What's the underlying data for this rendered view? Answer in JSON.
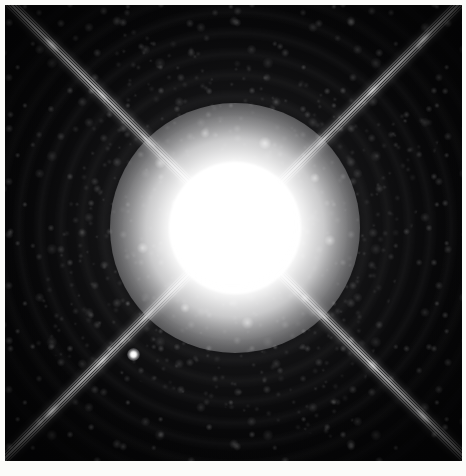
{
  "image": {
    "kind": "astronomical-photograph",
    "subject": "binary star system with diffraction spikes",
    "primary_star": {
      "name": "Sirius A",
      "role": "bright saturated primary",
      "center_x_pct": 50.3,
      "center_y_pct": 48.9,
      "core_radius_px": 66,
      "appearance": "overexposed white disk with mottled speckled halo"
    },
    "companion_star": {
      "name": "Sirius B",
      "role": "faint white-dwarf companion",
      "center_x_pct": 28.2,
      "center_y_pct": 76.6,
      "diameter_px": 13,
      "appearance": "small faint point of light lower-left of the primary"
    },
    "diffraction_spikes": {
      "count": 4,
      "pattern": "X-shaped cross",
      "angles_deg": [
        45,
        135,
        225,
        315
      ],
      "strand_count_per_spike": 5,
      "description": "multi-stranded spikes reaching all four corners of the frame"
    },
    "halo": {
      "description": "concentric Airy rings with speckled point-spread-function texture",
      "ring_spacing_px": 21
    },
    "frame": {
      "x": 5,
      "y": 5,
      "width": 457,
      "height": 456
    }
  },
  "colors": {
    "background_paper": "#fbfbf9",
    "sky_black": "#050506",
    "star_white": "#ffffff",
    "halo_gray": "#969698",
    "mid_gray": "#606063",
    "deep_gray": "#18181b"
  }
}
